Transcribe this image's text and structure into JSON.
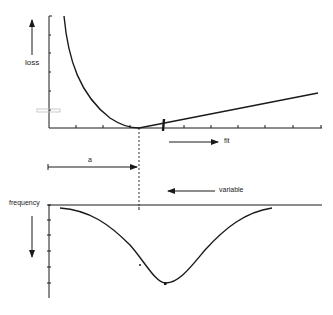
{
  "labels": {
    "loss": "loss",
    "fit": "fit",
    "a": "a",
    "variable": "variable",
    "frequency": "frequency"
  },
  "colors": {
    "ink": "#1a1a1a",
    "faint": "#bdbdbd"
  },
  "top_panel": {
    "y_axis_label": "loss",
    "x_arrow_label": "fit",
    "curve": "loss decreasing steeply to a minimum at the optimal value, then increasing linearly",
    "x_ticks_count": 11
  },
  "middle": {
    "distance_label": "a",
    "arrow_label": "variable"
  },
  "bottom_panel": {
    "y_axis_label": "frequency",
    "curve": "inverted bell-shaped frequency distribution centered to the right of the loss minimum",
    "y_ticks_count": 5
  }
}
